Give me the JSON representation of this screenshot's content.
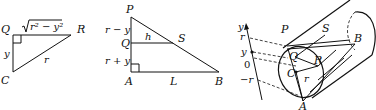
{
  "figure": {
    "panels": [
      {
        "id": "triangle-qcr",
        "vertices": [
          "Q",
          "R",
          "C"
        ],
        "labels": {
          "Q": "Q",
          "R": "R",
          "C": "C",
          "top_side": "√r² − y²",
          "top_side_radicand": "r² − y²",
          "left_side": "y",
          "hypotenuse": "r"
        },
        "right_angle_at": "Q"
      },
      {
        "id": "triangle-pab",
        "vertices": [
          "P",
          "A",
          "B",
          "Q",
          "S"
        ],
        "labels": {
          "P": "P",
          "Q": "Q",
          "A": "A",
          "B": "B",
          "S": "S",
          "upper_segment": "r − y",
          "lower_segment": "r + y",
          "h": "h",
          "L": "L"
        },
        "right_angle_at": "A"
      },
      {
        "id": "cylinder-wedge",
        "labels": {
          "P": "P",
          "S": "S",
          "B": "B",
          "Q": "Q",
          "R": "R",
          "C": "C",
          "r": "r",
          "A": "A"
        },
        "axis": {
          "name": "y",
          "ticks": [
            "r",
            "y",
            "0",
            "−r"
          ]
        }
      }
    ]
  }
}
